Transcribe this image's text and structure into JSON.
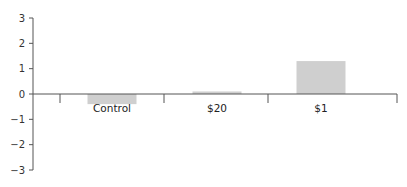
{
  "chart_data": {
    "type": "bar",
    "title": "",
    "xlabel": "",
    "ylabel": "",
    "categories": [
      "Control",
      "$20",
      "$1"
    ],
    "values": [
      -0.4,
      0.1,
      1.3
    ],
    "ylim": [
      -3,
      3
    ],
    "yticks": [
      3,
      2,
      1,
      0,
      -1,
      -2,
      -3
    ],
    "ytick_labels": [
      "3",
      "2",
      "1",
      "0",
      "−1",
      "−2",
      "−3"
    ],
    "grid": false,
    "legend": null,
    "bar_color": "#cfcfcf",
    "axis_color": "#555555"
  }
}
